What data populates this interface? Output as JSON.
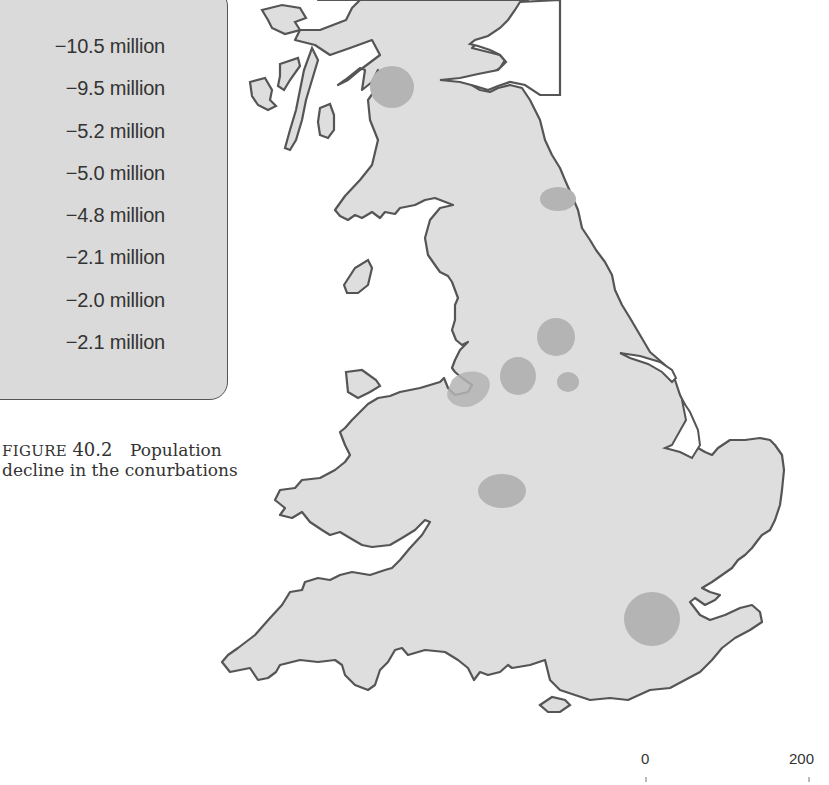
{
  "legend": {
    "items": [
      {
        "value": "−10.5 million"
      },
      {
        "value": "−9.5 million"
      },
      {
        "value": "−5.2 million"
      },
      {
        "value": "−5.0 million"
      },
      {
        "value": "−4.8 million"
      },
      {
        "value": "−2.1 million"
      },
      {
        "value": "−2.0 million"
      },
      {
        "value": "−2.1 million"
      }
    ]
  },
  "caption": {
    "label": "FIGURE",
    "number": "40.2",
    "title_line1": "Population",
    "title_line2": "decline in the conurbations"
  },
  "scale_bar": {
    "start": "0",
    "end": "200"
  },
  "colors": {
    "land": "#dedede",
    "coast": "#555555",
    "conurbation": "#b4b4b4",
    "legend_bg": "#dadada"
  },
  "map": {
    "region": "Great Britain",
    "conurbations_shown": 8
  }
}
